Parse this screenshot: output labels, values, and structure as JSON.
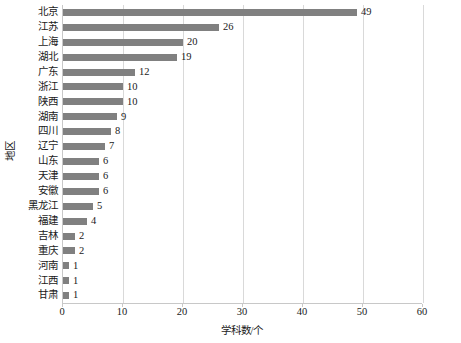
{
  "chart_data": {
    "type": "bar",
    "orientation": "horizontal",
    "title": "",
    "subtitle": "",
    "xlabel": "学科数/个",
    "ylabel": "地区",
    "xlim": [
      0,
      60
    ],
    "xticks": [
      0,
      10,
      20,
      30,
      40,
      50,
      60
    ],
    "grid": "vertical",
    "legend": "none",
    "bar_color": "#808080",
    "gridline_color": "#d9d9d9",
    "axis_color": "#c8c8c8",
    "text_color": "#1a1a1a",
    "categories": [
      "北京",
      "江苏",
      "上海",
      "湖北",
      "广东",
      "浙江",
      "陕西",
      "湖南",
      "四川",
      "辽宁",
      "山东",
      "天津",
      "安徽",
      "黑龙江",
      "福建",
      "吉林",
      "重庆",
      "河南",
      "江西",
      "甘肃"
    ],
    "values": [
      49,
      26,
      20,
      19,
      12,
      10,
      10,
      9,
      8,
      7,
      6,
      6,
      6,
      5,
      4,
      2,
      2,
      1,
      1,
      1
    ],
    "data_labels": [
      "49",
      "26",
      "20",
      "19",
      "12",
      "10",
      "10",
      "9",
      "8",
      "7",
      "6",
      "6",
      "6",
      "5",
      "4",
      "2",
      "2",
      "1",
      "1",
      "1"
    ],
    "tick_labels": [
      "0",
      "10",
      "20",
      "30",
      "40",
      "50",
      "60"
    ]
  }
}
